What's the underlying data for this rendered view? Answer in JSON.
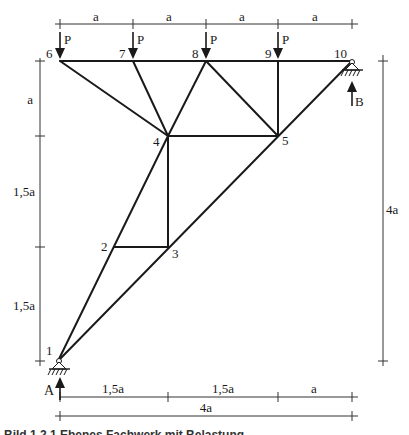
{
  "figure": {
    "nodes": [
      {
        "id": "1",
        "x": 58,
        "y": 361,
        "lx": 46,
        "ly": 356
      },
      {
        "id": "2",
        "x": 114,
        "y": 247,
        "lx": 101,
        "ly": 250
      },
      {
        "id": "3",
        "x": 168,
        "y": 247,
        "lx": 172,
        "ly": 258
      },
      {
        "id": "4",
        "x": 168,
        "y": 136,
        "lx": 152,
        "ly": 145
      },
      {
        "id": "5",
        "x": 278,
        "y": 136,
        "lx": 282,
        "ly": 144
      },
      {
        "id": "6",
        "x": 60,
        "y": 61,
        "lx": 46,
        "ly": 57
      },
      {
        "id": "7",
        "x": 133,
        "y": 61,
        "lx": 119,
        "ly": 57
      },
      {
        "id": "8",
        "x": 206,
        "y": 61,
        "lx": 192,
        "ly": 57
      },
      {
        "id": "9",
        "x": 278,
        "y": 61,
        "lx": 265,
        "ly": 57
      },
      {
        "id": "10",
        "x": 352,
        "y": 61,
        "lx": 334,
        "ly": 57
      }
    ],
    "members": [
      [
        "6",
        "10"
      ],
      [
        "6",
        "4"
      ],
      [
        "7",
        "4"
      ],
      [
        "8",
        "4"
      ],
      [
        "8",
        "5"
      ],
      [
        "9",
        "5"
      ],
      [
        "10",
        "1"
      ],
      [
        "4",
        "5"
      ],
      [
        "4",
        "3"
      ],
      [
        "4",
        "1"
      ],
      [
        "2",
        "3"
      ]
    ],
    "loads": [
      {
        "node": "6",
        "label": "P"
      },
      {
        "node": "7",
        "label": "P"
      },
      {
        "node": "8",
        "label": "P"
      },
      {
        "node": "9",
        "label": "P"
      }
    ],
    "supports": [
      {
        "node": "1",
        "reaction": "A"
      },
      {
        "node": "10",
        "reaction": "B"
      }
    ],
    "dimensions": {
      "top": {
        "labels": [
          "a",
          "a",
          "a",
          "a"
        ]
      },
      "left": {
        "labels": [
          "a",
          "1,5a",
          "1,5a"
        ]
      },
      "right": {
        "label": "4a"
      },
      "bottom_segments": {
        "labels": [
          "1,5a",
          "1,5a",
          "a"
        ]
      },
      "bottom_total": {
        "label": "4a"
      }
    },
    "caption": "Bild 1.2.1 Ebenes Fachwerk mit Belastung"
  }
}
